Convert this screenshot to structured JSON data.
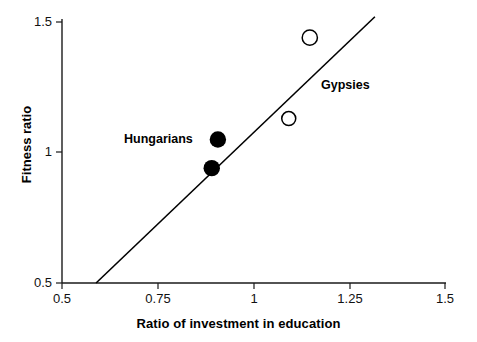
{
  "chart_data": {
    "type": "scatter",
    "title": "",
    "xlabel": "Ratio of investment in education",
    "ylabel": "Fitness ratio",
    "xlim": [
      0.5,
      1.5
    ],
    "ylim": [
      0.5,
      1.5
    ],
    "xticks": [
      "0.5",
      "0.75",
      "1",
      "1.25",
      "1.5"
    ],
    "xtick_values": [
      0.5,
      0.75,
      1,
      1.25,
      1.5
    ],
    "yticks": [
      "1.5",
      "1",
      "0.5"
    ],
    "ytick_values": [
      1.5,
      1,
      0.5
    ],
    "grid": false,
    "legend_position": "inline-annotations",
    "series": [
      {
        "name": "Hungarians",
        "marker": "filled-circle",
        "color": "#000000",
        "points": [
          {
            "x": 0.907,
            "y": 1.05
          },
          {
            "x": 0.891,
            "y": 0.94
          }
        ]
      },
      {
        "name": "Gypsies",
        "marker": "open-circle",
        "color": "#000000",
        "points": [
          {
            "x": 1.147,
            "y": 1.44
          },
          {
            "x": 1.092,
            "y": 1.13
          }
        ]
      }
    ],
    "trendline": {
      "name": "reference-line",
      "x_start": 0.589,
      "y_start": 0.5,
      "x_end": 1.317,
      "y_end": 1.52,
      "color": "#000000"
    },
    "annotations": [
      {
        "text": "Hungarians",
        "x": 0.735,
        "y": 1.05
      },
      {
        "text": "Gypsies",
        "x": 1.24,
        "y": 1.26
      }
    ]
  },
  "axes": {
    "x_title": "Ratio of investment in education",
    "y_title": "Fitness ratio",
    "x_tick_labels": [
      "0.5",
      "0.75",
      "1",
      "1.25",
      "1.5"
    ],
    "y_tick_labels": [
      "1.5",
      "1",
      "0.5"
    ]
  },
  "annotations": {
    "hungarians": "Hungarians",
    "gypsies": "Gypsies"
  },
  "colors": {
    "axis": "#1a1a1a",
    "marker_fill": "#000000",
    "marker_open_stroke": "#000000",
    "line": "#000000",
    "background": "#ffffff"
  }
}
